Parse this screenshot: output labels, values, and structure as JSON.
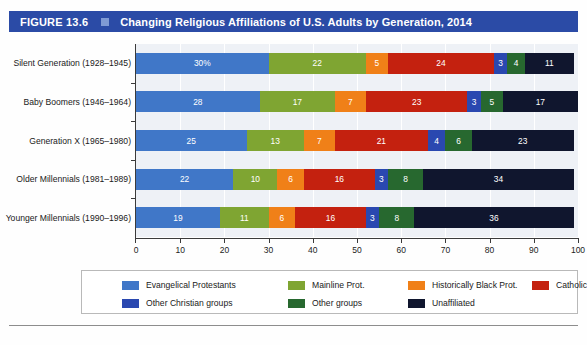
{
  "figure": {
    "number_label": "FIGURE 13.6",
    "title": "Changing Religious Affiliations of U.S. Adults by Generation, 2014",
    "header_bg": "#2b4ba6",
    "header_square": "#7f9ad4"
  },
  "chart_data": {
    "type": "bar",
    "orientation": "horizontal",
    "stacked": true,
    "title": "Changing Religious Affiliations of U.S. Adults by Generation, 2014",
    "xlabel": "",
    "ylabel": "",
    "xlim": [
      0,
      100
    ],
    "xticks": [
      0,
      10,
      20,
      30,
      40,
      50,
      60,
      70,
      80,
      90,
      100
    ],
    "xtick_labels": [
      "0",
      "10",
      "20",
      "30",
      "40",
      "50",
      "60",
      "70",
      "80",
      "90",
      "100"
    ],
    "grid": true,
    "legend_position": "bottom",
    "categories": [
      "Silent Generation (1928–1945)",
      "Baby Boomers (1946–1964)",
      "Generation X (1965–1980)",
      "Older Millennials (1981–1989)",
      "Younger Millennials (1990–1996)"
    ],
    "series": [
      {
        "name": "Evangelical Protestants",
        "color": "#4077c8",
        "values": [
          30,
          28,
          25,
          22,
          19
        ],
        "labels": [
          "30%",
          "28",
          "25",
          "22",
          "19"
        ]
      },
      {
        "name": "Mainline Prot.",
        "color": "#7fa532",
        "values": [
          22,
          17,
          13,
          10,
          11
        ],
        "labels": [
          "22",
          "17",
          "13",
          "10",
          "11"
        ]
      },
      {
        "name": "Historically Black Prot.",
        "color": "#f08018",
        "values": [
          5,
          7,
          7,
          6,
          6
        ],
        "labels": [
          "5",
          "7",
          "7",
          "6",
          "6"
        ]
      },
      {
        "name": "Catholic",
        "color": "#c4210f",
        "values": [
          24,
          23,
          21,
          16,
          16
        ],
        "labels": [
          "24",
          "23",
          "21",
          "16",
          "16"
        ]
      },
      {
        "name": "Other Christian groups",
        "color": "#2a48b0",
        "values": [
          3,
          3,
          4,
          3,
          3
        ],
        "labels": [
          "3",
          "3",
          "4",
          "3",
          "3"
        ]
      },
      {
        "name": "Other groups",
        "color": "#27682f",
        "values": [
          4,
          5,
          6,
          8,
          8
        ],
        "labels": [
          "4",
          "5",
          "6",
          "8",
          "8"
        ]
      },
      {
        "name": "Unaffiliated",
        "color": "#10162e",
        "values": [
          11,
          17,
          23,
          34,
          36
        ],
        "labels": [
          "11",
          "17",
          "23",
          "34",
          "36"
        ]
      }
    ]
  }
}
